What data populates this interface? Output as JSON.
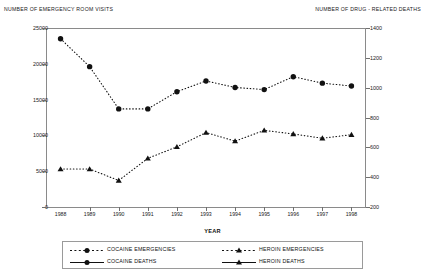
{
  "left_axis_title": "NUMBER OF EMERGENCY ROOM VISITS",
  "right_axis_title": "NUMBER OF DRUG - RELATED DEATHS",
  "x_axis_title": "YEAR",
  "legend": {
    "items": [
      {
        "label": "COCAINE EMERGENCIES",
        "marker": "circle",
        "line": "dotted"
      },
      {
        "label": "HEROIN EMERGENCIES",
        "marker": "triangle",
        "line": "dotted"
      },
      {
        "label": "COCAINE DEATHS",
        "marker": "circle",
        "line": "solid"
      },
      {
        "label": "HEROIN DEATHS",
        "marker": "triangle",
        "line": "solid"
      }
    ]
  },
  "ticks": {
    "left": [
      "25000",
      "20000",
      "15000",
      "10000",
      "5000",
      "0"
    ],
    "right": [
      "1400",
      "1200",
      "1000",
      "800",
      "600",
      "400",
      "200"
    ]
  },
  "chart_data": {
    "type": "line",
    "title": "",
    "xlabel": "YEAR",
    "ylabel": "NUMBER OF EMERGENCY ROOM VISITS",
    "y2label": "NUMBER OF DRUG - RELATED DEATHS",
    "categories": [
      "1988",
      "1989",
      "1990",
      "1991",
      "1992",
      "1993",
      "1994",
      "1995",
      "1996",
      "1997",
      "1998"
    ],
    "ylim": [
      0,
      25000
    ],
    "y2lim": [
      200,
      1400
    ],
    "yticks": [
      0,
      5000,
      10000,
      15000,
      20000,
      25000
    ],
    "y2ticks": [
      200,
      400,
      600,
      800,
      1000,
      1200,
      1400
    ],
    "grid": false,
    "legend_position": "bottom",
    "series": [
      {
        "name": "COCAINE EMERGENCIES",
        "axis": "left",
        "line": "dotted",
        "marker": "circle",
        "values": [
          23500,
          19600,
          13700,
          13700,
          16100,
          17600,
          16700,
          16400,
          18200,
          17300,
          16900
        ]
      },
      {
        "name": "HEROIN EMERGENCIES",
        "axis": "left",
        "line": "dotted",
        "marker": "triangle",
        "values": [
          5300,
          5300,
          3700,
          6800,
          8400,
          10400,
          9200,
          10700,
          10200,
          9600,
          10100
        ]
      },
      {
        "name": "COCAINE DEATHS",
        "axis": "right",
        "line": "solid",
        "marker": "circle",
        "values": [
          16900,
          15000,
          13300,
          12500,
          11400,
          12600,
          11900,
          14900,
          11700,
          8100,
          7000
        ]
      },
      {
        "name": "HEROIN DEATHS",
        "axis": "right",
        "line": "solid",
        "marker": "triangle",
        "values": [
          13000,
          11600,
          7200,
          7700,
          8400,
          12400,
          9100,
          11500,
          11600,
          7500,
          5600
        ]
      }
    ]
  }
}
